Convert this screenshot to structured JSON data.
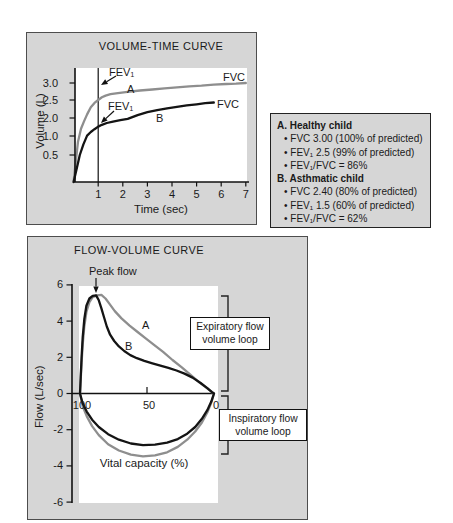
{
  "legend": {
    "items": [
      {
        "text": "A. Healthy child",
        "bold": true
      },
      {
        "text": "• FVC 3.00 (100% of predicted)",
        "bold": false
      },
      {
        "text": "• FEV₁ 2.5 (99% of predicted)",
        "bold": false
      },
      {
        "text": "• FEV₁/FVC = 86%",
        "bold": false
      },
      {
        "text": "B. Asthmatic child",
        "bold": true
      },
      {
        "text": "• FVC 2.40 (80% of predicted)",
        "bold": false
      },
      {
        "text": "• FEV₁ 1.5 (60% of predicted)",
        "bold": false
      },
      {
        "text": "• FEV₁/FVC = 62%",
        "bold": false
      }
    ]
  },
  "chart_data": [
    {
      "id": "volume_time",
      "type": "line",
      "title": "VOLUME-TIME CURVE",
      "xlabel": "Time (sec)",
      "ylabel": "Volume (L)",
      "x_ticks": [
        "1",
        "2",
        "3",
        "4",
        "5",
        "6",
        "7"
      ],
      "y_ticks": [
        {
          "label": "3.0",
          "value": 3.0
        },
        {
          "label": "2.5",
          "value": 2.5
        },
        {
          "label": "2.0",
          "value": 2.0
        },
        {
          "label": "1.0",
          "value": 1.0
        },
        {
          "label": "0.5",
          "value": 0.5
        }
      ],
      "xlim": [
        0,
        7
      ],
      "ylim": [
        0,
        3.4
      ],
      "grid": false,
      "legend_position": "none",
      "vertical_marker_x": 1,
      "annotations": {
        "fev1_a": "FEV₁",
        "curve_a": "A",
        "fvc_a": "FVC",
        "fev1_b": "FEV₁",
        "curve_b": "B",
        "fvc_b": "FVC"
      },
      "series": [
        {
          "name": "A (healthy child)",
          "color": "#8e8e8e",
          "points": [
            [
              0,
              0
            ],
            [
              0.08,
              0.35
            ],
            [
              0.18,
              0.85
            ],
            [
              0.3,
              1.4
            ],
            [
              0.42,
              1.8
            ],
            [
              0.55,
              2.1
            ],
            [
              0.7,
              2.3
            ],
            [
              0.85,
              2.42
            ],
            [
              1.0,
              2.5
            ],
            [
              1.15,
              2.58
            ],
            [
              1.3,
              2.63
            ],
            [
              1.5,
              2.67
            ],
            [
              1.8,
              2.7
            ],
            [
              2.2,
              2.74
            ],
            [
              2.7,
              2.78
            ],
            [
              3.2,
              2.81
            ],
            [
              3.7,
              2.84
            ],
            [
              4.2,
              2.87
            ],
            [
              4.7,
              2.9
            ],
            [
              5.2,
              2.92
            ],
            [
              5.7,
              2.95
            ],
            [
              6.2,
              2.97
            ],
            [
              6.6,
              2.98
            ],
            [
              7,
              3.0
            ]
          ]
        },
        {
          "name": "B (asthmatic child)",
          "color": "#141414",
          "points": [
            [
              0,
              0
            ],
            [
              0.1,
              0.2
            ],
            [
              0.25,
              0.5
            ],
            [
              0.4,
              0.78
            ],
            [
              0.55,
              1.02
            ],
            [
              0.7,
              1.22
            ],
            [
              0.85,
              1.38
            ],
            [
              1.0,
              1.52
            ],
            [
              1.15,
              1.62
            ],
            [
              1.35,
              1.72
            ],
            [
              1.6,
              1.8
            ],
            [
              1.9,
              1.88
            ],
            [
              2.2,
              1.95
            ],
            [
              2.6,
              2.08
            ],
            [
              3.0,
              2.16
            ],
            [
              3.4,
              2.22
            ],
            [
              3.8,
              2.27
            ],
            [
              4.2,
              2.31
            ],
            [
              4.6,
              2.35
            ],
            [
              5.0,
              2.38
            ],
            [
              5.35,
              2.41
            ],
            [
              5.7,
              2.43
            ]
          ]
        }
      ]
    },
    {
      "id": "flow_volume",
      "type": "line",
      "title": "FLOW-VOLUME CURVE",
      "xlabel": "Vital capacity (%)",
      "ylabel": "Flow (L/sec)",
      "x_axis_reversed": true,
      "x_ticks": [
        {
          "label": "100",
          "value": 100
        },
        {
          "label": "50",
          "value": 50
        },
        {
          "label": "0",
          "value": 0
        }
      ],
      "y_ticks": [
        {
          "label": "6",
          "value": 6
        },
        {
          "label": "4",
          "value": 4
        },
        {
          "label": "2",
          "value": 2
        },
        {
          "label": "0",
          "value": 0
        },
        {
          "label": "-2",
          "value": -2
        },
        {
          "label": "-4",
          "value": -4
        },
        {
          "label": "-6",
          "value": -6
        }
      ],
      "xlim": [
        100,
        0
      ],
      "ylim": [
        -6,
        6
      ],
      "grid": false,
      "annotations": {
        "peak_flow": "Peak flow",
        "curve_a": "A",
        "curve_b": "B",
        "expiratory_line1": "Expiratory flow",
        "expiratory_line2": "volume loop",
        "inspiratory_line1": "Inspiratory flow",
        "inspiratory_line2": "volume loop"
      },
      "series": [
        {
          "name": "A (healthy child)",
          "color": "#8e8e8e",
          "loop_points": [
            [
              100,
              0
            ],
            [
              99.5,
              0.75
            ],
            [
              98.8,
              1.7
            ],
            [
              98,
              2.7
            ],
            [
              96.8,
              3.7
            ],
            [
              95.2,
              4.5
            ],
            [
              93,
              5.05
            ],
            [
              90.5,
              5.32
            ],
            [
              87.5,
              5.42
            ],
            [
              84,
              5.45
            ],
            [
              81,
              5.25
            ],
            [
              78,
              4.95
            ],
            [
              74,
              4.55
            ],
            [
              69,
              4.15
            ],
            [
              63,
              3.75
            ],
            [
              57,
              3.4
            ],
            [
              51,
              3.05
            ],
            [
              45,
              2.7
            ],
            [
              38,
              2.3
            ],
            [
              31,
              1.85
            ],
            [
              24,
              1.45
            ],
            [
              17,
              1.0
            ],
            [
              11,
              0.62
            ],
            [
              5,
              0.28
            ],
            [
              1.5,
              0.07
            ],
            [
              0,
              0
            ],
            [
              2,
              -0.5
            ],
            [
              5,
              -1.05
            ],
            [
              9,
              -1.6
            ],
            [
              14,
              -2.1
            ],
            [
              20,
              -2.55
            ],
            [
              27,
              -2.95
            ],
            [
              35,
              -3.25
            ],
            [
              44,
              -3.42
            ],
            [
              53,
              -3.47
            ],
            [
              62,
              -3.38
            ],
            [
              71,
              -3.15
            ],
            [
              79,
              -2.8
            ],
            [
              86,
              -2.3
            ],
            [
              91,
              -1.8
            ],
            [
              95,
              -1.25
            ],
            [
              98,
              -0.7
            ],
            [
              100,
              0
            ]
          ]
        },
        {
          "name": "B (asthmatic child)",
          "color": "#141414",
          "loop_points": [
            [
              100,
              0
            ],
            [
              99.5,
              0.9
            ],
            [
              98.8,
              2.0
            ],
            [
              98,
              3.1
            ],
            [
              96.8,
              4.1
            ],
            [
              95.2,
              4.85
            ],
            [
              93,
              5.25
            ],
            [
              90.5,
              5.4
            ],
            [
              88,
              5.42
            ],
            [
              86,
              5.15
            ],
            [
              84,
              4.7
            ],
            [
              82,
              4.2
            ],
            [
              80,
              3.7
            ],
            [
              77.5,
              3.25
            ],
            [
              74.5,
              2.9
            ],
            [
              71,
              2.6
            ],
            [
              67,
              2.35
            ],
            [
              62.5,
              2.12
            ],
            [
              57.5,
              1.95
            ],
            [
              52,
              1.8
            ],
            [
              46,
              1.67
            ],
            [
              40,
              1.54
            ],
            [
              34,
              1.42
            ],
            [
              28,
              1.27
            ],
            [
              22,
              1.1
            ],
            [
              16,
              0.88
            ],
            [
              10,
              0.58
            ],
            [
              5,
              0.3
            ],
            [
              1.5,
              0.08
            ],
            [
              0,
              0
            ],
            [
              2,
              -0.45
            ],
            [
              5,
              -0.92
            ],
            [
              9,
              -1.4
            ],
            [
              14,
              -1.85
            ],
            [
              20,
              -2.22
            ],
            [
              27,
              -2.52
            ],
            [
              35,
              -2.72
            ],
            [
              44,
              -2.83
            ],
            [
              53,
              -2.85
            ],
            [
              62,
              -2.76
            ],
            [
              71,
              -2.55
            ],
            [
              79,
              -2.25
            ],
            [
              86,
              -1.85
            ],
            [
              91,
              -1.45
            ],
            [
              95,
              -1.0
            ],
            [
              98,
              -0.55
            ],
            [
              100,
              0
            ]
          ]
        }
      ]
    }
  ]
}
